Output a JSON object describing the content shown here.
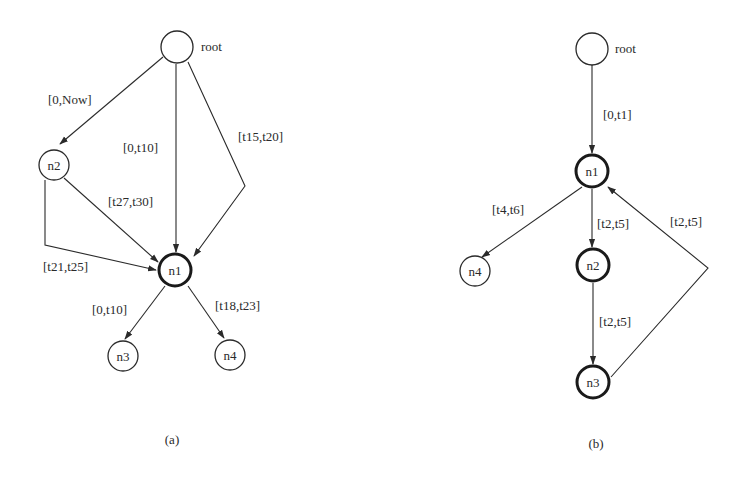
{
  "diagrams": [
    {
      "caption": "(a)",
      "nodes": [
        {
          "id": "root",
          "label": "",
          "side_label": "root",
          "bold": false
        },
        {
          "id": "n2",
          "label": "n2",
          "bold": false
        },
        {
          "id": "n1",
          "label": "n1",
          "bold": true
        },
        {
          "id": "n3",
          "label": "n3",
          "bold": false
        },
        {
          "id": "n4",
          "label": "n4",
          "bold": false
        }
      ],
      "edges": [
        {
          "from": "root",
          "to": "n2",
          "label": "[0,Now]"
        },
        {
          "from": "root",
          "to": "n1",
          "label": "[0,t10]"
        },
        {
          "from": "root",
          "to": "n1",
          "label": "[t15,t20]",
          "routed": true
        },
        {
          "from": "n2",
          "to": "n1",
          "label": "[t27,t30]"
        },
        {
          "from": "n2",
          "to": "n1",
          "label": "[t21,t25]",
          "routed": true
        },
        {
          "from": "n1",
          "to": "n3",
          "label": "[0,t10]"
        },
        {
          "from": "n1",
          "to": "n4",
          "label": "[t18,t23]"
        }
      ]
    },
    {
      "caption": "(b)",
      "nodes": [
        {
          "id": "root",
          "label": "",
          "side_label": "root",
          "bold": false
        },
        {
          "id": "n1",
          "label": "n1",
          "bold": true
        },
        {
          "id": "n4",
          "label": "n4",
          "bold": false
        },
        {
          "id": "n2",
          "label": "n2",
          "bold": true
        },
        {
          "id": "n3",
          "label": "n3",
          "bold": true
        }
      ],
      "edges": [
        {
          "from": "root",
          "to": "n1",
          "label": "[0,t1]"
        },
        {
          "from": "n1",
          "to": "n4",
          "label": "[t4,t6]"
        },
        {
          "from": "n1",
          "to": "n2",
          "label": "[t2,t5]"
        },
        {
          "from": "n2",
          "to": "n3",
          "label": "[t2,t5]"
        },
        {
          "from": "n3",
          "to": "n1",
          "label": "[t2,t5]",
          "routed": true
        }
      ]
    }
  ]
}
